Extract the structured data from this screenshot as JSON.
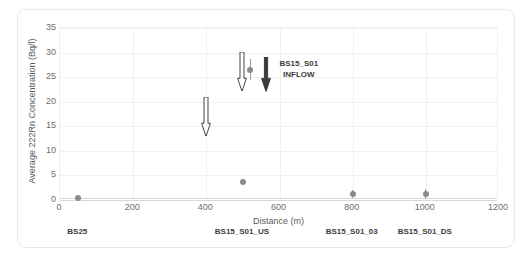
{
  "chart_data": {
    "type": "scatter",
    "title": "",
    "xlabel": "Distance (m)",
    "ylabel": "Average 222Rn Concentration (Bq/l)",
    "xlim": [
      0,
      1200
    ],
    "ylim": [
      0,
      35
    ],
    "xticks": [
      0,
      200,
      400,
      600,
      800,
      1000,
      1200
    ],
    "yticks": [
      0,
      5,
      10,
      15,
      20,
      25,
      30,
      35
    ],
    "grid": true,
    "legend": "none",
    "series": [
      {
        "name": "Average 222Rn Concentration",
        "marker": "circle",
        "color": "#8b8b8b",
        "points": [
          {
            "x": 50,
            "y": 0.4,
            "yerr": 0.3
          },
          {
            "x": 500,
            "y": 3.7,
            "yerr": 0.5
          },
          {
            "x": 520,
            "y": 26.5,
            "yerr": 2.1
          },
          {
            "x": 800,
            "y": 1.2,
            "yerr": 0.8
          },
          {
            "x": 1000,
            "y": 1.2,
            "yerr": 1.0
          }
        ]
      }
    ],
    "annotations": [
      {
        "kind": "arrow-outline",
        "name": "inflow-arrow-400",
        "x": 400,
        "y_from": 21.0,
        "y_to": 13.0,
        "direction": "down",
        "color": "#444444",
        "fill": "#ffffff"
      },
      {
        "kind": "arrow-outline",
        "name": "inflow-arrow-500",
        "x": 497,
        "y_from": 30.2,
        "y_to": 22.2,
        "direction": "down",
        "color": "#444444",
        "fill": "#ffffff"
      },
      {
        "kind": "arrow-solid",
        "name": "inflow-arrow-560",
        "x": 562,
        "y_from": 29.0,
        "y_to": 22.0,
        "direction": "down",
        "color": "#3a3a3a"
      },
      {
        "kind": "text",
        "name": "inflow-annotation",
        "line1": "BS15_S01",
        "line2": "INFLOW",
        "x": 600,
        "y": 27.5
      }
    ],
    "category_labels": [
      {
        "label": "BS25",
        "x": 50
      },
      {
        "label": "BS15_S01_US",
        "x": 500
      },
      {
        "label": "BS15_S01_03",
        "x": 800
      },
      {
        "label": "BS15_S01_DS",
        "x": 1000
      }
    ]
  },
  "colors": {
    "marker": "#8b8b8b",
    "errorbar": "#9a9a9a",
    "grid": "#f0f0f2",
    "axis": "#d8d8dc",
    "tick_text": "#6d6d6d",
    "axis_label": "#5a5a5a",
    "category_text": "#3d3d3d",
    "arrow_solid": "#3a3a3a",
    "arrow_outline": "#444444",
    "figure_border": "#e9e9ec",
    "background": "#ffffff"
  }
}
